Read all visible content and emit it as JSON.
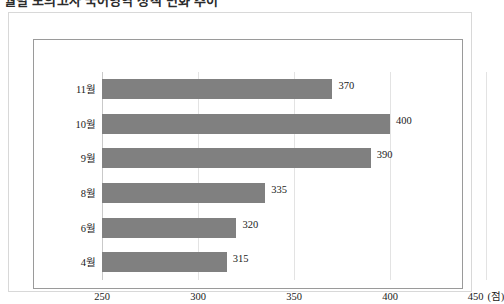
{
  "title": {
    "text": "월별 모의고사 국어영역 성적 변화 추이",
    "clipped": true
  },
  "chart_data": {
    "type": "bar",
    "orientation": "horizontal",
    "title": "",
    "xlabel": "(점)",
    "ylabel": "",
    "categories": [
      "11월",
      "10월",
      "9월",
      "8월",
      "6월",
      "4월"
    ],
    "values": [
      370,
      400,
      390,
      335,
      320,
      315
    ],
    "data_labels": [
      "370",
      "400",
      "390",
      "335",
      "320",
      "315"
    ],
    "xlim": [
      250,
      450
    ],
    "xticks": [
      250,
      300,
      350,
      400,
      450
    ],
    "xtick_labels": [
      "250",
      "300",
      "350",
      "400",
      "450"
    ],
    "x_unit_label": "(점)",
    "grid": true,
    "grid_axis": "x",
    "legend": false,
    "bar_color": "#808080",
    "grid_color": "#e3e3e3",
    "axis_color": "#9a9a9a",
    "frame_color": "#d8d8d8",
    "text_color": "#1a1a1a"
  }
}
